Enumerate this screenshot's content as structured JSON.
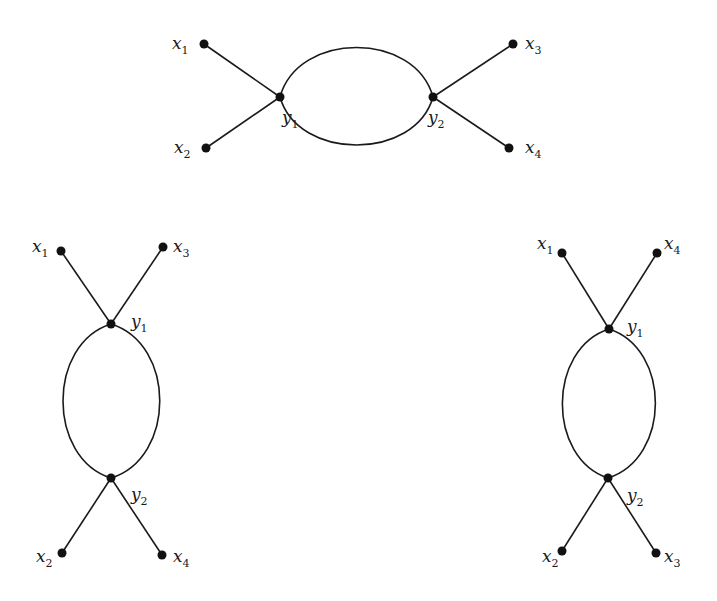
{
  "diagrams": [
    {
      "id": "top",
      "orientation": "horizontal",
      "internal_nodes": [
        {
          "name": "y",
          "sub": "1",
          "x": 280,
          "y": 97,
          "lx": 282,
          "ly": 123
        },
        {
          "name": "y",
          "sub": "2",
          "x": 433,
          "y": 97,
          "lx": 428,
          "ly": 123
        }
      ],
      "external_nodes": [
        {
          "name": "x",
          "sub": "1",
          "x": 204,
          "y": 44,
          "lx": 172,
          "ly": 49,
          "attach": 0
        },
        {
          "name": "x",
          "sub": "2",
          "x": 206,
          "y": 148,
          "lx": 174,
          "ly": 153,
          "attach": 0
        },
        {
          "name": "x",
          "sub": "3",
          "x": 513,
          "y": 44,
          "lx": 525,
          "ly": 49,
          "attach": 1
        },
        {
          "name": "x",
          "sub": "4",
          "x": 509,
          "y": 148,
          "lx": 525,
          "ly": 153,
          "attach": 1
        }
      ],
      "loop": {
        "cx": 356.5,
        "cy": 97,
        "top": 45,
        "bottom": 147
      }
    },
    {
      "id": "left",
      "orientation": "vertical",
      "internal_nodes": [
        {
          "name": "y",
          "sub": "1",
          "x": 111,
          "y": 324,
          "lx": 131,
          "ly": 327
        },
        {
          "name": "y",
          "sub": "2",
          "x": 111,
          "y": 478,
          "lx": 131,
          "ly": 500
        }
      ],
      "external_nodes": [
        {
          "name": "x",
          "sub": "1",
          "x": 61,
          "y": 251,
          "lx": 32,
          "ly": 252,
          "attach": 0
        },
        {
          "name": "x",
          "sub": "3",
          "x": 163,
          "y": 247,
          "lx": 173,
          "ly": 252,
          "attach": 0
        },
        {
          "name": "x",
          "sub": "2",
          "x": 62,
          "y": 553,
          "lx": 36,
          "ly": 562,
          "attach": 1
        },
        {
          "name": "x",
          "sub": "4",
          "x": 162,
          "y": 555,
          "lx": 173,
          "ly": 562,
          "attach": 1
        }
      ],
      "loop": {
        "cx": 111,
        "cy": 401,
        "left": 61,
        "right": 162
      }
    },
    {
      "id": "right",
      "orientation": "vertical",
      "internal_nodes": [
        {
          "name": "y",
          "sub": "1",
          "x": 609,
          "y": 329,
          "lx": 627,
          "ly": 332
        },
        {
          "name": "y",
          "sub": "2",
          "x": 608,
          "y": 478,
          "lx": 627,
          "ly": 501
        }
      ],
      "external_nodes": [
        {
          "name": "x",
          "sub": "1",
          "x": 562,
          "y": 253,
          "lx": 537,
          "ly": 249,
          "attach": 0
        },
        {
          "name": "x",
          "sub": "4",
          "x": 657,
          "y": 253,
          "lx": 664,
          "ly": 249,
          "attach": 0
        },
        {
          "name": "x",
          "sub": "2",
          "x": 562,
          "y": 551,
          "lx": 542,
          "ly": 562,
          "attach": 1
        },
        {
          "name": "x",
          "sub": "3",
          "x": 656,
          "y": 553,
          "lx": 664,
          "ly": 562,
          "attach": 1
        }
      ],
      "loop": {
        "cx": 608.5,
        "cy": 403.5,
        "left": 561,
        "right": 657
      }
    }
  ],
  "colors": {
    "ink": "#1a1a1a",
    "background": "#ffffff"
  }
}
